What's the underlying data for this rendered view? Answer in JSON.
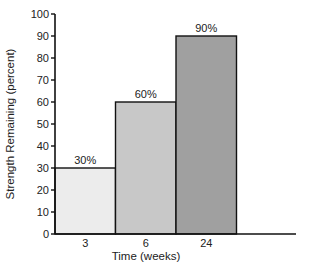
{
  "chart_data": {
    "type": "bar",
    "title": "",
    "categories": [
      "3",
      "6",
      "24"
    ],
    "values": [
      30,
      60,
      90
    ],
    "data_labels": [
      "30%",
      "60%",
      "90%"
    ],
    "bar_colors": [
      "#ececec",
      "#c8c8c8",
      "#a0a0a0"
    ],
    "xlabel": "Time (weeks)",
    "ylabel": "Strength Remaining (percent)",
    "ylim": [
      0,
      100
    ],
    "yticks": [
      0,
      10,
      20,
      30,
      40,
      50,
      60,
      70,
      80,
      90,
      100
    ],
    "grid": false,
    "legend": null
  }
}
